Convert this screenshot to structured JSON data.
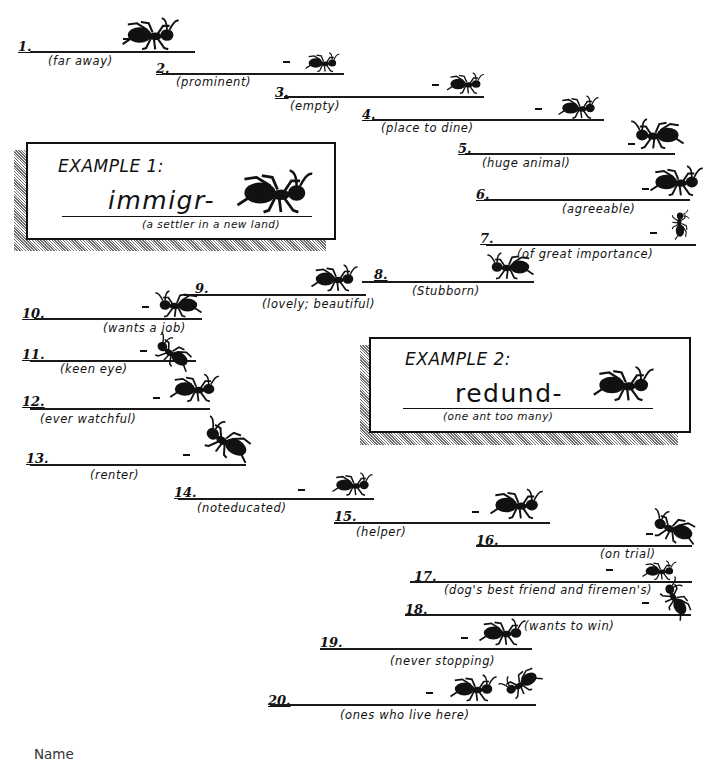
{
  "worksheet": {
    "examples": [
      {
        "title": "EXAMPLE 1:",
        "word": "immigr-",
        "hint": "(a settler in a new land)"
      },
      {
        "title": "EXAMPLE 2:",
        "word": "redund-",
        "hint": "(one ant too many)"
      }
    ],
    "items": [
      {
        "number": "1.",
        "hint": "(far away)"
      },
      {
        "number": "2.",
        "hint": "(prominent)"
      },
      {
        "number": "3.",
        "hint": "(empty)"
      },
      {
        "number": "4.",
        "hint": "(place to dine)"
      },
      {
        "number": "5.",
        "hint": "(huge animal)"
      },
      {
        "number": "6.",
        "hint": "(agreeable)"
      },
      {
        "number": "7.",
        "hint": "(of great importance)"
      },
      {
        "number": "8.",
        "hint": "(Stubborn)"
      },
      {
        "number": "9.",
        "hint": "(lovely; beautiful)"
      },
      {
        "number": "10.",
        "hint": "(wants a job)"
      },
      {
        "number": "11.",
        "hint": "(keen eye)"
      },
      {
        "number": "12.",
        "hint": "(ever watchful)"
      },
      {
        "number": "13.",
        "hint": "(renter)"
      },
      {
        "number": "14.",
        "hint": "(noteducated)"
      },
      {
        "number": "15.",
        "hint": "(helper)"
      },
      {
        "number": "16.",
        "hint": "(on trial)"
      },
      {
        "number": "17.",
        "hint": "(dog's best friend and firemen's)"
      },
      {
        "number": "18.",
        "hint": "(wants to win)"
      },
      {
        "number": "19.",
        "hint": "(never stopping)"
      },
      {
        "number": "20.",
        "hint": "(ones who live here)"
      }
    ],
    "footer": {
      "name_label": "Name"
    }
  }
}
